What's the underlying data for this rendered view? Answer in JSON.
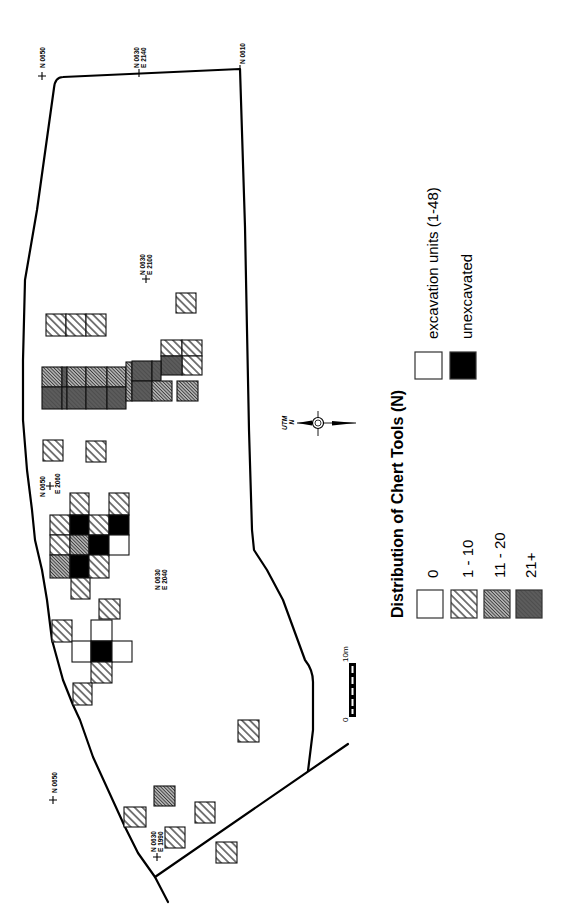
{
  "legend": {
    "title": "Distribution of Chert Tools (N)",
    "unit_types": [
      {
        "key": "excavated",
        "label": "excavation units (1-48)"
      },
      {
        "key": "unexcavated",
        "label": "unexcavated"
      }
    ],
    "counts": [
      {
        "key": "0",
        "label": "0"
      },
      {
        "key": "1-10",
        "label": "1 - 10"
      },
      {
        "key": "11-20",
        "label": "11 - 20"
      },
      {
        "key": "21+",
        "label": "21+"
      }
    ]
  },
  "grid_labels": [
    {
      "n": "N 0650"
    },
    {
      "n": "N 0630",
      "e": "E 2140"
    },
    {
      "n": "N 0610"
    },
    {
      "n": "N 0630",
      "e": "E 2100"
    },
    {
      "n": "N 0650",
      "e": "E 2060"
    },
    {
      "n": "N 0630",
      "e": "E 2040"
    },
    {
      "n": "N 0650"
    },
    {
      "n": "N 0630",
      "e": "E 1990"
    }
  ],
  "compass": {
    "label_top": "UTM",
    "label_bottom": "N"
  },
  "scale_bar": {
    "start": "0",
    "end": "10m"
  },
  "colors": {
    "outline": "#000000",
    "unexcavated": "#000000",
    "count_0": "#ffffff",
    "count_11_20": "#8f8f8f",
    "count_21_plus": "#5c5c5c"
  },
  "map": {
    "units": [
      {
        "cat": "1-10",
        "x": 176,
        "y": 293,
        "w": 20,
        "h": 20
      },
      {
        "cat": "1-10",
        "x": 46,
        "y": 314,
        "w": 20,
        "h": 22
      },
      {
        "cat": "1-10",
        "x": 66,
        "y": 314,
        "w": 20,
        "h": 22
      },
      {
        "cat": "1-10",
        "x": 86,
        "y": 314,
        "w": 20,
        "h": 22
      },
      {
        "cat": "1-10",
        "x": 161,
        "y": 340,
        "w": 21,
        "h": 16
      },
      {
        "cat": "1-10",
        "x": 182,
        "y": 340,
        "w": 20,
        "h": 16
      },
      {
        "cat": "1-10",
        "x": 182,
        "y": 356,
        "w": 20,
        "h": 19
      },
      {
        "cat": "21+",
        "x": 161,
        "y": 356,
        "w": 21,
        "h": 19
      },
      {
        "cat": "11-20",
        "x": 42,
        "y": 367,
        "w": 20,
        "h": 20
      },
      {
        "cat": "21+",
        "x": 62,
        "y": 367,
        "w": 5,
        "h": 20
      },
      {
        "cat": "11-20",
        "x": 67,
        "y": 367,
        "w": 19,
        "h": 20
      },
      {
        "cat": "11-20",
        "x": 86,
        "y": 367,
        "w": 21,
        "h": 20
      },
      {
        "cat": "11-20",
        "x": 107,
        "y": 367,
        "w": 19,
        "h": 20
      },
      {
        "cat": "21+",
        "x": 42,
        "y": 387,
        "w": 20,
        "h": 22
      },
      {
        "cat": "21+",
        "x": 62,
        "y": 387,
        "w": 5,
        "h": 22
      },
      {
        "cat": "21+",
        "x": 67,
        "y": 387,
        "w": 19,
        "h": 22
      },
      {
        "cat": "21+",
        "x": 86,
        "y": 387,
        "w": 21,
        "h": 22
      },
      {
        "cat": "21+",
        "x": 107,
        "y": 387,
        "w": 19,
        "h": 22
      },
      {
        "cat": "11-20",
        "x": 126,
        "y": 362,
        "w": 6,
        "h": 39
      },
      {
        "cat": "21+",
        "x": 132,
        "y": 361,
        "w": 20,
        "h": 20
      },
      {
        "cat": "21+",
        "x": 152,
        "y": 361,
        "w": 9,
        "h": 20
      },
      {
        "cat": "21+",
        "x": 132,
        "y": 381,
        "w": 20,
        "h": 20
      },
      {
        "cat": "11-20",
        "x": 152,
        "y": 381,
        "w": 20,
        "h": 20
      },
      {
        "cat": "11-20",
        "x": 177,
        "y": 381,
        "w": 21,
        "h": 20
      },
      {
        "cat": "1-10",
        "x": 43,
        "y": 440,
        "w": 20,
        "h": 21
      },
      {
        "cat": "1-10",
        "x": 86,
        "y": 441,
        "w": 20,
        "h": 21
      },
      {
        "cat": "1-10",
        "x": 70,
        "y": 493,
        "w": 19,
        "h": 22
      },
      {
        "cat": "1-10",
        "x": 109,
        "y": 493,
        "w": 20,
        "h": 22
      },
      {
        "cat": "1-10",
        "x": 50,
        "y": 515,
        "w": 20,
        "h": 20
      },
      {
        "cat": "unexcavated",
        "x": 70,
        "y": 515,
        "w": 19,
        "h": 20
      },
      {
        "cat": "1-10",
        "x": 89,
        "y": 515,
        "w": 20,
        "h": 20
      },
      {
        "cat": "unexcavated",
        "x": 109,
        "y": 515,
        "w": 20,
        "h": 20
      },
      {
        "cat": "1-10",
        "x": 50,
        "y": 535,
        "w": 20,
        "h": 20
      },
      {
        "cat": "11-20",
        "x": 70,
        "y": 535,
        "w": 19,
        "h": 20
      },
      {
        "cat": "unexcavated",
        "x": 89,
        "y": 535,
        "w": 20,
        "h": 20
      },
      {
        "cat": "0",
        "x": 109,
        "y": 535,
        "w": 20,
        "h": 20
      },
      {
        "cat": "11-20",
        "x": 50,
        "y": 555,
        "w": 20,
        "h": 23
      },
      {
        "cat": "unexcavated",
        "x": 70,
        "y": 555,
        "w": 19,
        "h": 23
      },
      {
        "cat": "1-10",
        "x": 89,
        "y": 555,
        "w": 20,
        "h": 23
      },
      {
        "cat": "1-10",
        "x": 71,
        "y": 578,
        "w": 19,
        "h": 21
      },
      {
        "cat": "1-10",
        "x": 99,
        "y": 599,
        "w": 21,
        "h": 20
      },
      {
        "cat": "1-10",
        "x": 52,
        "y": 620,
        "w": 20,
        "h": 22
      },
      {
        "cat": "0",
        "x": 91,
        "y": 620,
        "w": 21,
        "h": 21
      },
      {
        "cat": "0",
        "x": 72,
        "y": 641,
        "w": 19,
        "h": 21
      },
      {
        "cat": "unexcavated",
        "x": 91,
        "y": 641,
        "w": 21,
        "h": 21
      },
      {
        "cat": "0",
        "x": 112,
        "y": 641,
        "w": 20,
        "h": 21
      },
      {
        "cat": "1-10",
        "x": 91,
        "y": 662,
        "w": 21,
        "h": 21
      },
      {
        "cat": "1-10",
        "x": 73,
        "y": 683,
        "w": 19,
        "h": 22
      },
      {
        "cat": "1-10",
        "x": 238,
        "y": 720,
        "w": 21,
        "h": 22
      },
      {
        "cat": "11-20",
        "x": 154,
        "y": 786,
        "w": 21,
        "h": 20
      },
      {
        "cat": "1-10",
        "x": 124,
        "y": 807,
        "w": 22,
        "h": 20
      },
      {
        "cat": "1-10",
        "x": 195,
        "y": 802,
        "w": 20,
        "h": 21
      },
      {
        "cat": "1-10",
        "x": 165,
        "y": 827,
        "w": 20,
        "h": 21
      },
      {
        "cat": "1-10",
        "x": 216,
        "y": 842,
        "w": 21,
        "h": 21
      }
    ]
  }
}
